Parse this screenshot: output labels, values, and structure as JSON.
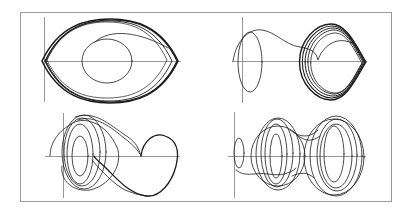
{
  "figure": {
    "frame": {
      "x": 20,
      "y": 12,
      "w": 371,
      "h": 189,
      "color": "#9a9a9a"
    },
    "axis_color": "#8c8c8c",
    "curve_color": "#1c1c1c"
  },
  "chart_data": [
    {
      "type": "line",
      "title": "",
      "position": "top-left",
      "description": "Phase portrait: inner closed loop converging to outer eye-shaped limit cycle",
      "xlabel": "",
      "ylabel": "",
      "grid": false,
      "axes": {
        "y_axis_x": 44,
        "y_range_px": [
          17,
          102
        ],
        "x_axis_y": 61,
        "x_range_px": [
          44,
          181
        ]
      },
      "series": [
        {
          "name": "inner-loop",
          "kind": "ellipse",
          "cx": 107,
          "cy": 61,
          "rx": 25,
          "ry": 22,
          "width": 0.8
        },
        {
          "name": "transient-arc",
          "kind": "path",
          "d": "M 95 42 C 110 28, 140 32, 168 48",
          "width": 0.8
        },
        {
          "name": "limit-cycle-1",
          "kind": "eye",
          "cx": 110,
          "cy": 61,
          "rx": 68,
          "ry": 42,
          "width": 1.6
        },
        {
          "name": "limit-cycle-2",
          "kind": "eye",
          "cx": 111,
          "cy": 61,
          "rx": 66,
          "ry": 41,
          "width": 1.2
        },
        {
          "name": "limit-cycle-3",
          "kind": "eye",
          "cx": 109,
          "cy": 61,
          "rx": 63,
          "ry": 40,
          "width": 0.9
        },
        {
          "name": "limit-cycle-4",
          "kind": "eye",
          "cx": 107,
          "cy": 60,
          "rx": 60,
          "ry": 38,
          "width": 0.7
        }
      ]
    },
    {
      "type": "line",
      "title": "",
      "position": "top-right",
      "description": "Phase portrait: small loop near origin, transient trajectory with cusp, converging to rounded-diamond limit cycle",
      "xlabel": "",
      "ylabel": "",
      "grid": false,
      "axes": {
        "y_axis_x": 242,
        "y_range_px": [
          17,
          103
        ],
        "x_axis_y": 61,
        "x_range_px": [
          232,
          367
        ]
      },
      "series": [
        {
          "name": "small-loop",
          "kind": "ellipse",
          "cx": 250,
          "cy": 62,
          "rx": 12,
          "ry": 30,
          "width": 0.8
        },
        {
          "name": "transient",
          "kind": "path",
          "d": "M 233 61 C 236 40, 250 28, 262 30 C 276 32, 285 45, 300 47 C 312 49, 316 52, 318 60 C 322 48, 335 35, 352 43",
          "width": 0.8
        },
        {
          "name": "limit-cycle-1",
          "kind": "diamond",
          "cx": 331,
          "cy": 62,
          "rx": 35,
          "ry": 38,
          "width": 1.4
        },
        {
          "name": "limit-cycle-2",
          "kind": "diamond",
          "cx": 332,
          "cy": 62,
          "rx": 33,
          "ry": 36,
          "width": 1.1
        },
        {
          "name": "limit-cycle-3",
          "kind": "diamond",
          "cx": 333,
          "cy": 62,
          "rx": 31,
          "ry": 34,
          "width": 1.0
        },
        {
          "name": "limit-cycle-4",
          "kind": "diamond",
          "cx": 334,
          "cy": 62,
          "rx": 29,
          "ry": 32,
          "width": 0.9
        },
        {
          "name": "limit-cycle-5",
          "kind": "diamond",
          "cx": 335,
          "cy": 63,
          "rx": 27,
          "ry": 30,
          "width": 0.8
        }
      ]
    },
    {
      "type": "line",
      "title": "",
      "position": "bottom-left",
      "description": "Phase portrait: multiple nested loops on left, heart-shaped lobe on right (chaotic attractor)",
      "xlabel": "",
      "ylabel": "",
      "grid": false,
      "axes": {
        "y_axis_x": 63,
        "y_range_px": [
          113,
          198
        ],
        "x_axis_y": 156,
        "x_range_px": [
          45,
          180
        ]
      },
      "series": [
        {
          "name": "loop-1",
          "kind": "ellipse",
          "cx": 80,
          "cy": 156,
          "rx": 8,
          "ry": 20,
          "width": 0.8
        },
        {
          "name": "loop-2",
          "kind": "ellipse",
          "cx": 80,
          "cy": 154,
          "rx": 13,
          "ry": 30,
          "width": 0.8
        },
        {
          "name": "loop-3",
          "kind": "ellipse",
          "cx": 82,
          "cy": 152,
          "rx": 18,
          "ry": 34,
          "width": 0.8
        },
        {
          "name": "loop-4",
          "kind": "ellipse",
          "cx": 84,
          "cy": 152,
          "rx": 22,
          "ry": 37,
          "width": 0.8
        },
        {
          "name": "outer-left",
          "kind": "path",
          "d": "M 50 156 C 50 140, 62 128, 75 122 C 90 116, 110 128, 118 150 C 122 168, 108 186, 90 190 C 72 192, 60 180, 62 166",
          "width": 0.8
        },
        {
          "name": "bridge-upper",
          "kind": "path",
          "d": "M 75 117 C 95 110, 110 125, 125 135 C 133 140, 138 145, 141 156",
          "width": 0.8
        },
        {
          "name": "bridge-upper-2",
          "kind": "path",
          "d": "M 78 120 C 95 114, 112 128, 124 138 C 132 144, 136 148, 140 154",
          "width": 0.8
        },
        {
          "name": "heart-lobe",
          "kind": "path",
          "d": "M 141 156 C 143 140, 155 132, 165 136 C 176 140, 180 150, 176 166 C 172 182, 160 198, 146 196 C 130 194, 118 180, 108 170 C 100 162, 96 160, 94 156",
          "width": 1.3
        },
        {
          "name": "cross-lower",
          "kind": "path",
          "d": "M 92 160 C 100 170, 115 185, 125 190 C 135 194, 142 196, 150 196",
          "width": 0.8
        }
      ]
    },
    {
      "type": "line",
      "title": "",
      "position": "bottom-right",
      "description": "Phase portrait: small loop near origin, two families of nested loops (double-scroll chaotic attractor)",
      "xlabel": "",
      "ylabel": "",
      "grid": false,
      "axes": {
        "y_axis_x": 234,
        "y_range_px": [
          112,
          198
        ],
        "x_axis_y": 156,
        "x_range_px": [
          228,
          366
        ]
      },
      "series": [
        {
          "name": "small-loop",
          "kind": "ellipse",
          "cx": 239,
          "cy": 153,
          "rx": 5,
          "ry": 15,
          "width": 0.8
        },
        {
          "name": "tail",
          "kind": "path",
          "d": "M 236 170 C 245 178, 255 172, 268 174 C 280 176, 290 174, 296 168",
          "width": 0.8
        },
        {
          "name": "left-loop-1",
          "kind": "ellipse",
          "cx": 276,
          "cy": 156,
          "rx": 6,
          "ry": 22,
          "width": 0.8
        },
        {
          "name": "left-loop-2",
          "kind": "ellipse",
          "cx": 276,
          "cy": 154,
          "rx": 11,
          "ry": 30,
          "width": 0.8
        },
        {
          "name": "left-loop-3",
          "kind": "ellipse",
          "cx": 277,
          "cy": 153,
          "rx": 16,
          "ry": 34,
          "width": 0.8
        },
        {
          "name": "left-loop-4",
          "kind": "ellipse",
          "cx": 278,
          "cy": 154,
          "rx": 22,
          "ry": 36,
          "width": 0.8
        },
        {
          "name": "left-loop-5",
          "kind": "ellipse",
          "cx": 278,
          "cy": 156,
          "rx": 27,
          "ry": 30,
          "width": 0.8
        },
        {
          "name": "right-loop-1",
          "kind": "ellipse",
          "cx": 334,
          "cy": 154,
          "rx": 10,
          "ry": 28,
          "width": 0.8
        },
        {
          "name": "right-loop-2",
          "kind": "ellipse",
          "cx": 336,
          "cy": 156,
          "rx": 16,
          "ry": 32,
          "width": 0.8
        },
        {
          "name": "right-loop-3",
          "kind": "ellipse",
          "cx": 337,
          "cy": 155,
          "rx": 20,
          "ry": 36,
          "width": 0.8
        },
        {
          "name": "right-loop-4",
          "kind": "ellipse",
          "cx": 336,
          "cy": 156,
          "rx": 26,
          "ry": 40,
          "width": 0.8
        },
        {
          "name": "right-loop-5",
          "kind": "ellipse",
          "cx": 334,
          "cy": 157,
          "rx": 30,
          "ry": 38,
          "width": 0.8
        },
        {
          "name": "bridge-1",
          "kind": "path",
          "d": "M 290 130 C 300 138, 310 138, 318 130",
          "width": 0.8
        },
        {
          "name": "bridge-2",
          "kind": "path",
          "d": "M 292 176 C 300 172, 308 172, 314 178",
          "width": 0.8
        },
        {
          "name": "bridge-3",
          "kind": "path",
          "d": "M 296 134 C 305 142, 312 142, 320 136",
          "width": 0.8
        }
      ]
    }
  ]
}
